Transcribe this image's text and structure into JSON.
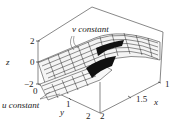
{
  "figure": {
    "type": "3d-wireframe-surface",
    "annotations": {
      "v_label": "v constant",
      "u_label": "u constant"
    },
    "axes": {
      "z": {
        "label": "z",
        "ticks": [
          "2",
          "0",
          "−2"
        ]
      },
      "y": {
        "label": "y",
        "ticks": [
          "0",
          "1",
          "2"
        ]
      },
      "x": {
        "label": "x",
        "ticks": [
          "1",
          "1.5",
          "2"
        ]
      }
    },
    "colors": {
      "line": "#333333",
      "background": "#ffffff",
      "mesh": "#1a1a1a"
    }
  }
}
